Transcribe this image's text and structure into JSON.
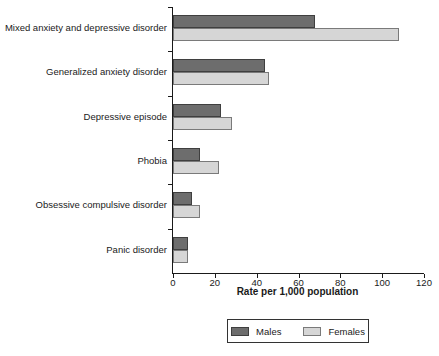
{
  "chart_data": {
    "type": "bar",
    "orientation": "horizontal",
    "title": "",
    "categories": [
      "Mixed anxiety and depressive disorder",
      "Generalized anxiety disorder",
      "Depressive episode",
      "Phobia",
      "Obsessive compulsive disorder",
      "Panic disorder"
    ],
    "series": [
      {
        "name": "Males",
        "color": "#6d6d6d",
        "border_color": "#3f3f3f",
        "values": [
          68,
          44,
          23,
          13,
          9,
          7
        ]
      },
      {
        "name": "Females",
        "color": "#d6d6d6",
        "border_color": "#7a7a7a",
        "values": [
          108,
          46,
          28,
          22,
          13,
          7
        ]
      }
    ],
    "xlabel": "Rate per 1,000 population",
    "ylabel": "",
    "xlim": [
      0,
      120
    ],
    "xticks": [
      0,
      20,
      40,
      60,
      80,
      100,
      120
    ],
    "grid": false,
    "legend_position": "bottom",
    "axis_color": "#1a1a1a",
    "background_color": "#ffffff"
  }
}
